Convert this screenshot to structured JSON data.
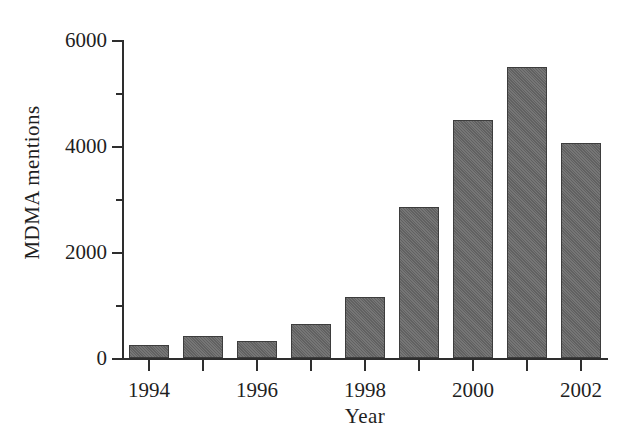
{
  "chart_data": {
    "type": "bar",
    "title": "",
    "xlabel": "Year",
    "ylabel": "MDMA mentions",
    "categories": [
      "1994",
      "1995",
      "1996",
      "1997",
      "1998",
      "1999",
      "2000",
      "2001",
      "2002"
    ],
    "values": [
      250,
      420,
      320,
      640,
      1150,
      2850,
      4500,
      5500,
      4050
    ],
    "xlim": [
      1993.5,
      2002.5
    ],
    "ylim": [
      0,
      6000
    ],
    "y_major_ticks": [
      0,
      2000,
      4000,
      6000
    ],
    "y_major_tick_labels": [
      "0",
      "2000",
      "4000",
      "6000"
    ],
    "y_minor_ticks": [
      1000,
      3000,
      5000
    ],
    "x_major_ticks": [
      "1994",
      "1996",
      "1998",
      "2000",
      "2002"
    ],
    "x_minor_ticks": [
      "1995",
      "1997",
      "1999",
      "2001"
    ],
    "grid": false,
    "legend": null,
    "bar_color": "#676767",
    "bar_edge_color": "#3d3d3d",
    "axis_color": "#2e2e2e",
    "background_color": "#ffffff"
  }
}
